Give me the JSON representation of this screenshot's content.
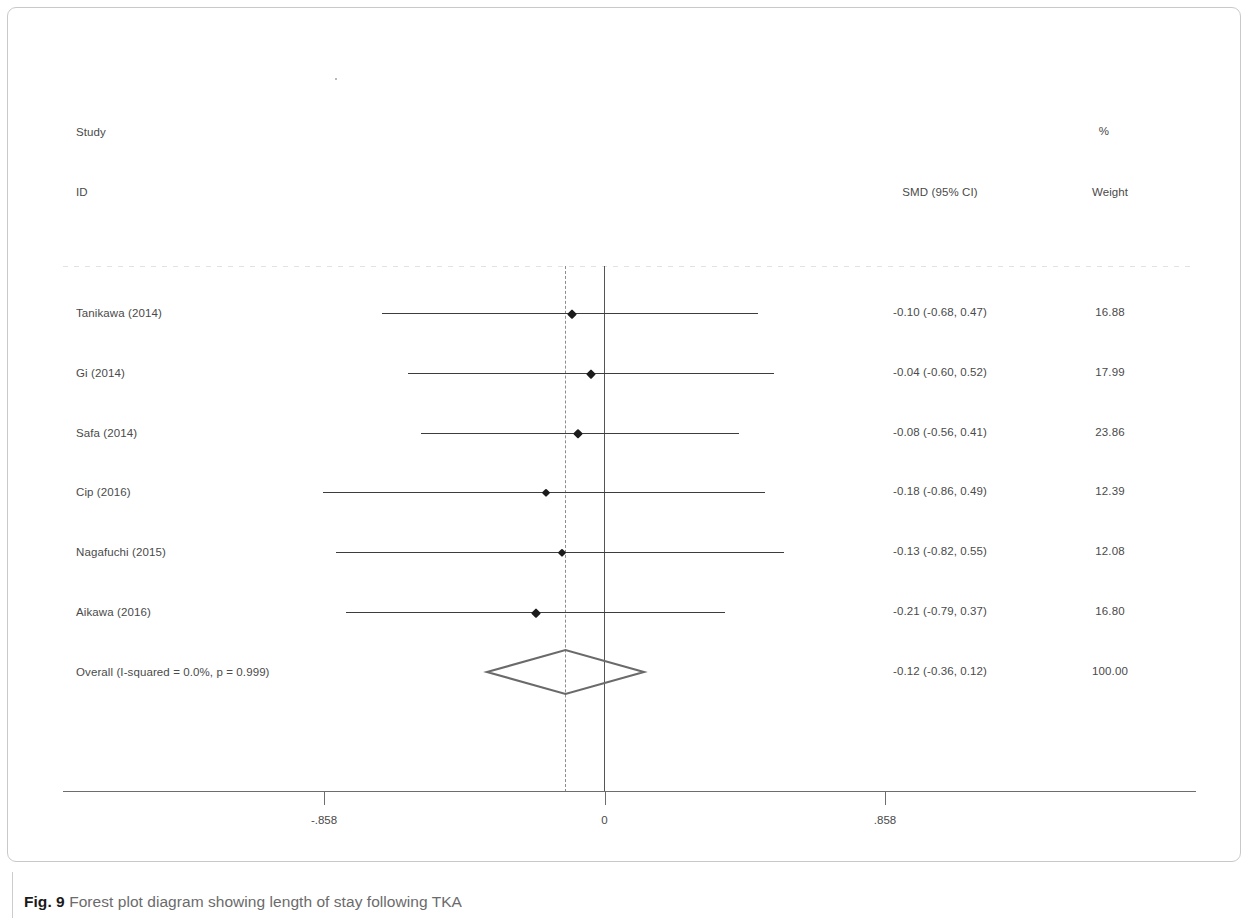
{
  "figure": {
    "caption_number": "Fig. 9",
    "caption_text": " Forest plot diagram showing length of stay following TKA"
  },
  "headers": {
    "study": "Study",
    "id": "ID",
    "effect": "SMD (95% CI)",
    "percent": "%",
    "weight": "Weight"
  },
  "chart_data": {
    "type": "forest",
    "title": "",
    "xlabel": "",
    "ylabel": "",
    "effect_measure": "SMD (95% CI)",
    "null_value": 0,
    "xlim": [
      -1.24,
      1.24
    ],
    "grid": false,
    "legend": "none",
    "axis_ticks": [
      {
        "label": "-.858",
        "value": -0.858
      },
      {
        "label": "0",
        "value": 0
      },
      {
        "label": ".858",
        "value": 0.858
      }
    ],
    "heterogeneity": "I-squared = 0.0%, p = 0.999",
    "studies": [
      {
        "label": "Tanikawa  (2014)",
        "effect": -0.1,
        "ci_low": -0.68,
        "ci_high": 0.47,
        "effect_text": "-0.10 (-0.68, 0.47)",
        "weight": 16.88,
        "weight_text": "16.88"
      },
      {
        "label": "Gi (2014)",
        "effect": -0.04,
        "ci_low": -0.6,
        "ci_high": 0.52,
        "effect_text": "-0.04 (-0.60, 0.52)",
        "weight": 17.99,
        "weight_text": "17.99"
      },
      {
        "label": "Safa (2014)",
        "effect": -0.08,
        "ci_low": -0.56,
        "ci_high": 0.41,
        "effect_text": "-0.08 (-0.56, 0.41)",
        "weight": 23.86,
        "weight_text": "23.86"
      },
      {
        "label": "Cip  (2016)",
        "effect": -0.18,
        "ci_low": -0.86,
        "ci_high": 0.49,
        "effect_text": "-0.18 (-0.86, 0.49)",
        "weight": 12.39,
        "weight_text": "12.39"
      },
      {
        "label": "Nagafuchi  (2015)",
        "effect": -0.13,
        "ci_low": -0.82,
        "ci_high": 0.55,
        "effect_text": "-0.13 (-0.82, 0.55)",
        "weight": 12.08,
        "weight_text": "12.08"
      },
      {
        "label": "Aikawa (2016)",
        "effect": -0.21,
        "ci_low": -0.79,
        "ci_high": 0.37,
        "effect_text": "-0.21 (-0.79, 0.37)",
        "weight": 16.8,
        "weight_text": "16.80"
      }
    ],
    "overall": {
      "label": "Overall  (I-squared = 0.0%, p = 0.999)",
      "effect": -0.12,
      "ci_low": -0.36,
      "ci_high": 0.12,
      "effect_text": "-0.12 (-0.36, 0.12)",
      "weight": 100.0,
      "weight_text": "100.00"
    }
  },
  "colors": {
    "line": "#3d3d3d",
    "marker": "#1c1c1c",
    "diamond": "#6a6a6a",
    "zero_line": "#555555",
    "pooled_line": "#8d8d8d",
    "text": "#4a4a4a"
  }
}
